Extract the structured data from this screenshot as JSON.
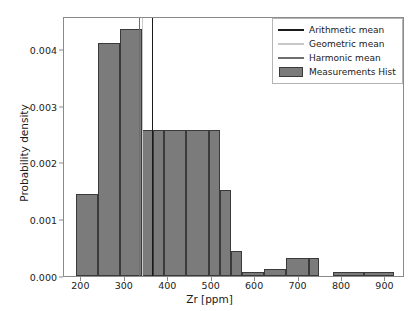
{
  "chart_data": {
    "type": "bar",
    "title": "",
    "xlabel": "Zr [ppm]",
    "ylabel": "Probability density",
    "xlim": [
      160,
      945
    ],
    "ylim": [
      0.0,
      0.00458
    ],
    "grid": false,
    "legend_position": "upper right",
    "xticks": [
      200,
      300,
      400,
      500,
      600,
      700,
      800,
      900
    ],
    "xtick_labels": [
      "200",
      "300",
      "400",
      "500",
      "600",
      "700",
      "800",
      "900"
    ],
    "yticks": [
      0.0,
      0.001,
      0.002,
      0.003,
      0.004
    ],
    "ytick_labels": [
      "0.000",
      "0.001",
      "0.002",
      "0.003",
      "0.004"
    ],
    "bin_edges": [
      187,
      238,
      289,
      340,
      391,
      442,
      493,
      544,
      595,
      646,
      697,
      748,
      799,
      850,
      901,
      920
    ],
    "bars": [
      {
        "x0": 187,
        "x1": 238,
        "height": 0.00145
      },
      {
        "x0": 238,
        "x1": 289,
        "height": 0.00411
      },
      {
        "x0": 289,
        "x1": 340,
        "height": 0.00435
      },
      {
        "x0": 340,
        "x1": 365,
        "height": 0.00258
      },
      {
        "x0": 365,
        "x1": 391,
        "height": 0.00258
      },
      {
        "x0": 391,
        "x1": 442,
        "height": 0.00258
      },
      {
        "x0": 442,
        "x1": 493,
        "height": 0.00258
      },
      {
        "x0": 493,
        "x1": 519,
        "height": 0.00258
      },
      {
        "x0": 519,
        "x1": 544,
        "height": 0.00151
      },
      {
        "x0": 544,
        "x1": 570,
        "height": 0.00044
      },
      {
        "x0": 570,
        "x1": 621,
        "height": 7e-05
      },
      {
        "x0": 621,
        "x1": 672,
        "height": 0.00013
      },
      {
        "x0": 672,
        "x1": 723,
        "height": 0.00031
      },
      {
        "x0": 723,
        "x1": 748,
        "height": 0.00031
      },
      {
        "x0": 780,
        "x1": 850,
        "height": 7e-05
      },
      {
        "x0": 850,
        "x1": 920,
        "height": 7e-05
      }
    ],
    "series": [
      {
        "name": "Measurements Hist",
        "type": "histogram",
        "color": "#7b7b7b",
        "edge_color": "#3a3a3a"
      },
      {
        "name": "Arithmetic mean",
        "type": "vline",
        "value": 363,
        "color": "#1a1a1a"
      },
      {
        "name": "Geometric mean",
        "type": "vline",
        "value": 340,
        "color": "#c8c8c8"
      },
      {
        "name": "Harmonic mean",
        "type": "vline",
        "value": 332,
        "color": "#6e6e6e"
      }
    ]
  },
  "legend": {
    "entries": [
      {
        "label": "Arithmetic mean",
        "key": "line",
        "color": "#1a1a1a"
      },
      {
        "label": "Geometric mean",
        "key": "line",
        "color": "#c8c8c8"
      },
      {
        "label": "Harmonic mean",
        "key": "line",
        "color": "#6e6e6e"
      },
      {
        "label": "Measurements Hist",
        "key": "patch",
        "color": "#7b7b7b"
      }
    ]
  }
}
